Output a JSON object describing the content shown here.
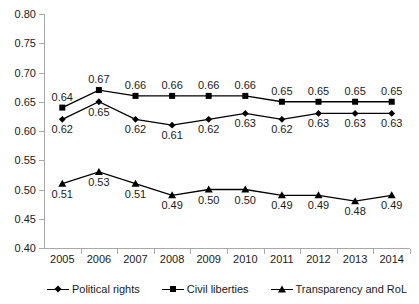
{
  "chart_data": {
    "type": "line",
    "title": "",
    "subtitle": "",
    "xlabel": "",
    "ylabel": "",
    "categories": [
      "2005",
      "2006",
      "2007",
      "2008",
      "2009",
      "2010",
      "2011",
      "2012",
      "2013",
      "2014"
    ],
    "ylim": [
      0.4,
      0.8
    ],
    "ytick_labels": [
      "0.80",
      "0.75",
      "0.70",
      "0.65",
      "0.60",
      "0.55",
      "0.50",
      "0.45",
      "0.40"
    ],
    "ytick_values": [
      0.8,
      0.75,
      0.7,
      0.65,
      0.6,
      0.55,
      0.5,
      0.45,
      0.4
    ],
    "grid": false,
    "legend_position": "bottom",
    "series": [
      {
        "name": "Political rights",
        "marker": "diamond",
        "values": [
          0.62,
          0.65,
          0.62,
          0.61,
          0.62,
          0.63,
          0.62,
          0.63,
          0.63,
          0.63
        ],
        "labels": [
          "0.62",
          "0.65",
          "0.62",
          "0.61",
          "0.62",
          "0.63",
          "0.62",
          "0.63",
          "0.63",
          "0.63"
        ],
        "label_side": [
          "below",
          "below",
          "below",
          "below",
          "below",
          "below",
          "below",
          "below",
          "below",
          "below"
        ]
      },
      {
        "name": "Civil liberties",
        "marker": "square",
        "values": [
          0.64,
          0.67,
          0.66,
          0.66,
          0.66,
          0.66,
          0.65,
          0.65,
          0.65,
          0.65
        ],
        "labels": [
          "0.64",
          "0.67",
          "0.66",
          "0.66",
          "0.66",
          "0.66",
          "0.65",
          "0.65",
          "0.65",
          "0.65"
        ],
        "label_side": [
          "above",
          "above",
          "above",
          "above",
          "above",
          "above",
          "above",
          "above",
          "above",
          "above"
        ]
      },
      {
        "name": "Transparency and  RoL",
        "marker": "triangle",
        "values": [
          0.51,
          0.53,
          0.51,
          0.49,
          0.5,
          0.5,
          0.49,
          0.49,
          0.48,
          0.49
        ],
        "labels": [
          "0.51",
          "0.53",
          "0.51",
          "0.49",
          "0.50",
          "0.50",
          "0.49",
          "0.49",
          "0.48",
          "0.49"
        ],
        "label_side": [
          "below",
          "below",
          "below",
          "below",
          "below",
          "below",
          "below",
          "below",
          "below",
          "below"
        ]
      }
    ],
    "colors": {
      "series_line": "#000000",
      "axis": "#a9a9a9",
      "text": "#1a1a1a",
      "background": "#ffffff"
    }
  }
}
